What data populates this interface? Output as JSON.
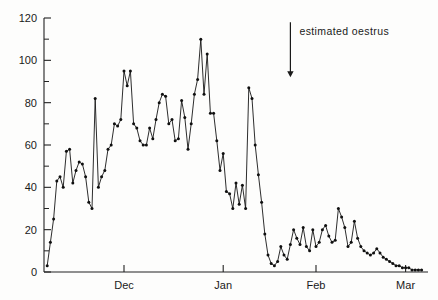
{
  "chart_data": {
    "type": "line",
    "title": "",
    "subtitle": "",
    "xlabel": "",
    "ylabel": "",
    "xlim": [
      0,
      120
    ],
    "ylim": [
      0,
      120
    ],
    "grid": false,
    "legend": null,
    "markers": "filled-circle",
    "y_ticks_major": [
      0,
      20,
      40,
      60,
      80,
      100,
      120
    ],
    "y_ticks_minor": [
      10,
      30,
      50,
      70,
      90,
      110
    ],
    "y_tick_labels": [
      "0",
      "20",
      "40",
      "60",
      "80",
      "100",
      "120"
    ],
    "x_tick_labels": [
      "Dec",
      "Jan",
      "Feb",
      "Mar"
    ],
    "x_tick_positions": [
      25,
      56,
      85,
      113
    ],
    "annotations": [
      {
        "text": "estimated oestrus",
        "x": 77,
        "y_top": 118,
        "y_bottom": 92,
        "arrow": "down"
      }
    ],
    "x": [
      1,
      2,
      3,
      4,
      5,
      6,
      7,
      8,
      9,
      10,
      11,
      12,
      13,
      14,
      15,
      16,
      17,
      18,
      19,
      20,
      21,
      22,
      23,
      24,
      25,
      26,
      27,
      28,
      29,
      30,
      31,
      32,
      33,
      34,
      35,
      36,
      37,
      38,
      39,
      40,
      41,
      42,
      43,
      44,
      45,
      46,
      47,
      48,
      49,
      50,
      51,
      52,
      53,
      54,
      55,
      56,
      57,
      58,
      59,
      60,
      61,
      62,
      63,
      64,
      65,
      66,
      67,
      68,
      69,
      70,
      71,
      72,
      73,
      74,
      75,
      76,
      77,
      78,
      79,
      80,
      81,
      82,
      83,
      84,
      85,
      86,
      87,
      88,
      89,
      90,
      91,
      92,
      93,
      94,
      95,
      96,
      97,
      98,
      99,
      100,
      101,
      102,
      103,
      104,
      105,
      106,
      107,
      108,
      109,
      110,
      111,
      112,
      113,
      114,
      115,
      116,
      117,
      118
    ],
    "values": [
      3,
      14,
      25,
      43,
      45,
      40,
      57,
      58,
      42,
      48,
      52,
      51,
      45,
      33,
      30,
      82,
      40,
      45,
      48,
      58,
      60,
      70,
      69,
      72,
      95,
      88,
      95,
      70,
      68,
      62,
      60,
      60,
      68,
      63,
      72,
      80,
      84,
      83,
      70,
      72,
      62,
      63,
      81,
      73,
      58,
      70,
      84,
      91,
      110,
      84,
      103,
      75,
      75,
      62,
      48,
      56,
      38,
      37,
      30,
      42,
      32,
      41,
      30,
      87,
      82,
      60,
      46,
      33,
      18,
      8,
      4,
      3,
      5,
      12,
      8,
      6,
      13,
      20,
      16,
      13,
      21,
      12,
      10,
      20,
      12,
      14,
      20,
      22,
      17,
      14,
      15,
      30,
      26,
      21,
      12,
      14,
      24,
      16,
      12,
      10,
      9,
      8,
      9,
      11,
      9,
      7,
      6,
      5,
      4,
      3,
      3,
      2,
      2,
      2,
      1,
      1,
      1,
      1
    ],
    "axis_color": "#222222",
    "series_color": "#151515"
  },
  "figure": {
    "background": "#fdfdfc"
  }
}
